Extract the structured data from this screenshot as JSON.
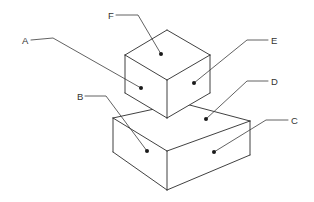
{
  "figure": {
    "background_color": "#ffffff",
    "line_color": "#2b2b2b",
    "leader_color": "#3a3a3a",
    "label_color": "#333333",
    "width": 314,
    "height": 202
  },
  "solids": {
    "upper_block": {
      "name": "cube",
      "top_face": "125,55 167,30 210,55 167,80",
      "left_face": "125,55 167,80 167,118 125,93",
      "right_face": "167,80 210,55 210,93 167,118",
      "edges": {
        "top_left_back": "125,55 167,30",
        "top_right_back": "167,30 210,55",
        "top_left_front": "125,55 167,80",
        "top_right_front": "167,80 210,55",
        "vertical_left": "125,55 125,93",
        "vertical_center": "167,80 167,118",
        "vertical_right": "210,55 210,93",
        "bottom_left_front": "125,93 167,118",
        "bottom_right_front": "167,118 210,93"
      }
    },
    "lower_block": {
      "name": "slab",
      "top_face": "113,118 182,103 250,121 167,151",
      "left_face": "113,118 167,151 167,190 113,152",
      "right_face": "167,151 250,121 250,155 167,190",
      "edges": {
        "top_left_back": "113,118 182,103",
        "top_right_back": "182,103 250,121",
        "top_left_front": "113,118 167,151",
        "top_right_front": "167,151 250,121",
        "vertical_left": "113,118 113,152",
        "vertical_center": "167,151 167,190",
        "vertical_right": "250,121 250,155",
        "bottom_left_front": "113,152 167,190",
        "bottom_right_front": "167,190 250,155"
      }
    }
  },
  "callouts": [
    {
      "id": "A",
      "label": "A",
      "label_x": 22,
      "label_y": 44,
      "target_face": "cube-left-face",
      "dot_x": 141,
      "dot_y": 88,
      "leader_path": "M 31 40 L 53 38 L 141 88"
    },
    {
      "id": "B",
      "label": "B",
      "label_x": 77,
      "label_y": 100,
      "target_face": "slab-left-face",
      "dot_x": 147,
      "dot_y": 151,
      "leader_path": "M 85 96 L 106 96 L 147 151"
    },
    {
      "id": "C",
      "label": "C",
      "label_x": 291,
      "label_y": 124,
      "target_face": "slab-right-face",
      "dot_x": 214,
      "dot_y": 152,
      "leader_path": "M 288 120 L 266 120 L 214 152"
    },
    {
      "id": "D",
      "label": "D",
      "label_x": 271,
      "label_y": 85,
      "target_face": "slab-top-face",
      "dot_x": 206,
      "dot_y": 119,
      "leader_path": "M 268 81 L 247 81 L 206 119"
    },
    {
      "id": "E",
      "label": "E",
      "label_x": 271,
      "label_y": 44,
      "target_face": "cube-right-face",
      "dot_x": 194,
      "dot_y": 83,
      "leader_path": "M 268 40 L 247 40 L 194 83"
    },
    {
      "id": "F",
      "label": "F",
      "label_x": 108,
      "label_y": 19,
      "target_face": "cube-top-face",
      "dot_x": 161,
      "dot_y": 54,
      "leader_path": "M 116 15 L 138 15 L 161 54"
    }
  ]
}
